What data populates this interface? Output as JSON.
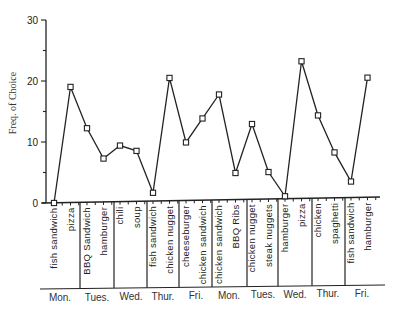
{
  "chart_data": {
    "type": "line",
    "title": "",
    "xlabel": "",
    "ylabel": "Freq. of Choice",
    "ylim": [
      0,
      30
    ],
    "yticks": [
      0,
      10,
      20,
      30
    ],
    "grid": false,
    "legend": null,
    "marker": "square",
    "categories": [
      "fish sandwich",
      "pizza",
      "BBQ Sandwich",
      "hamburger",
      "chili",
      "soup",
      "fish sandwich",
      "chicken nugget",
      "cheeseburger",
      "chicken sandwich",
      "chicken sandwich",
      "BBQ Ribs",
      "chicken nugget",
      "steak nuggets",
      "hamburger",
      "pizza",
      "chicken",
      "spaghetti",
      "fish sandwich",
      "hamburger"
    ],
    "days": [
      "Mon.",
      "Tues.",
      "Wed.",
      "Thur.",
      "Fri.",
      "Mon.",
      "Tues.",
      "Wed.",
      "Thur.",
      "Fri."
    ],
    "series": [
      {
        "name": "Freq. of Choice",
        "values": [
          0,
          19,
          12.2,
          7.2,
          9.3,
          8.4,
          1.5,
          20.3,
          9.7,
          13.6,
          17.5,
          4.6,
          12.6,
          4.7,
          0.7,
          22.8,
          13.9,
          7.8,
          3.0,
          20.0
        ]
      }
    ]
  },
  "axis": {
    "y_tick_labels": [
      "0",
      "10",
      "20",
      "30"
    ]
  }
}
